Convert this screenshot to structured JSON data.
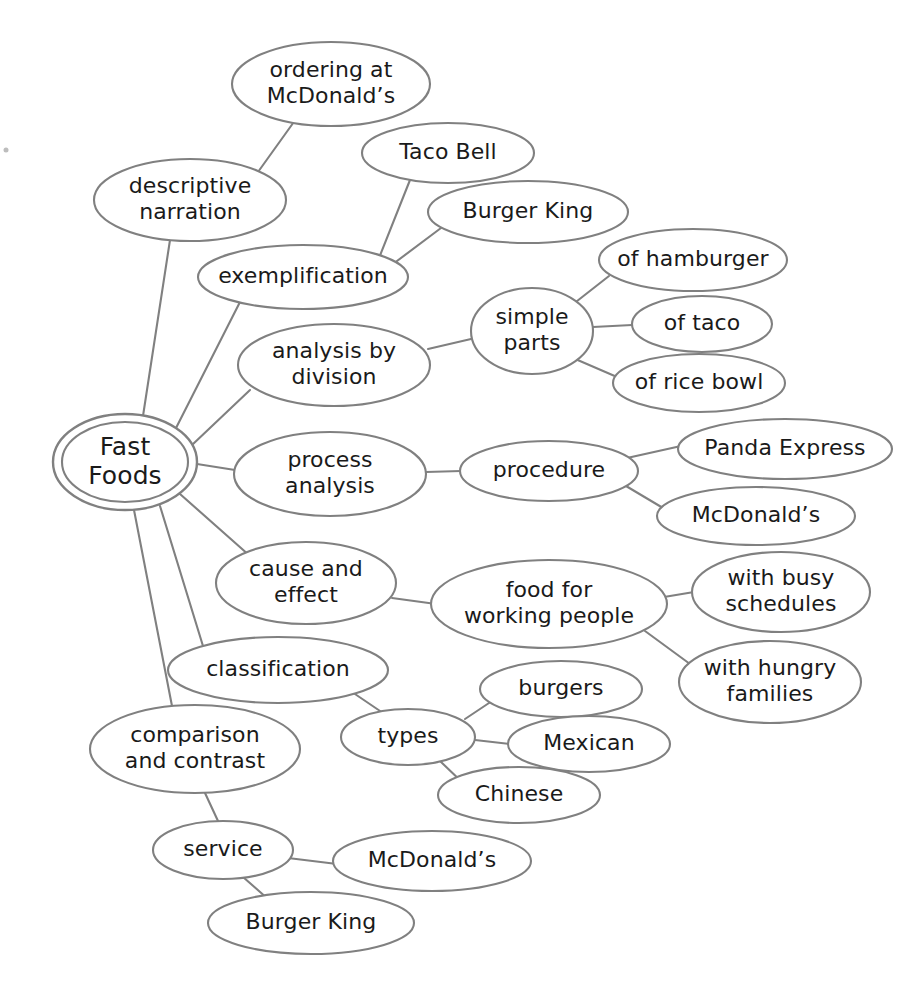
{
  "diagram": {
    "type": "mind-map",
    "style": {
      "background": "#ffffff",
      "node_fill": "#ffffff",
      "node_stroke": "#808080",
      "text_color": "#1a1a1a"
    },
    "root": {
      "id": "fast-foods",
      "label": "Fast Foods",
      "lines": [
        "Fast",
        "Foods"
      ],
      "cx": 125,
      "cy": 462,
      "rx": 72,
      "ry": 48,
      "double_ring": true
    },
    "nodes": [
      {
        "id": "ordering-at-mcdonalds",
        "label": "ordering at McDonald's",
        "lines": [
          "ordering at",
          "McDonald’s"
        ],
        "cx": 331,
        "cy": 84,
        "rx": 99,
        "ry": 42
      },
      {
        "id": "descriptive-narration",
        "label": "descriptive narration",
        "lines": [
          "descriptive",
          "narration"
        ],
        "cx": 190,
        "cy": 200,
        "rx": 96,
        "ry": 41
      },
      {
        "id": "taco-bell",
        "label": "Taco Bell",
        "lines": [
          "Taco Bell"
        ],
        "cx": 448,
        "cy": 153,
        "rx": 86,
        "ry": 30
      },
      {
        "id": "burger-king-ex",
        "label": "Burger King",
        "lines": [
          "Burger King"
        ],
        "cx": 528,
        "cy": 212,
        "rx": 100,
        "ry": 31
      },
      {
        "id": "exemplification",
        "label": "exemplification",
        "lines": [
          "exemplification"
        ],
        "cx": 303,
        "cy": 277,
        "rx": 105,
        "ry": 32
      },
      {
        "id": "of-hamburger",
        "label": "of hamburger",
        "lines": [
          "of hamburger"
        ],
        "cx": 693,
        "cy": 260,
        "rx": 94,
        "ry": 31
      },
      {
        "id": "simple-parts",
        "label": "simple parts",
        "lines": [
          "simple",
          "parts"
        ],
        "cx": 532,
        "cy": 331,
        "rx": 61,
        "ry": 43
      },
      {
        "id": "of-taco",
        "label": "of taco",
        "lines": [
          "of taco"
        ],
        "cx": 702,
        "cy": 324,
        "rx": 70,
        "ry": 28
      },
      {
        "id": "analysis-by-division",
        "label": "analysis by division",
        "lines": [
          "analysis by",
          "division"
        ],
        "cx": 334,
        "cy": 365,
        "rx": 96,
        "ry": 41
      },
      {
        "id": "of-rice-bowl",
        "label": "of rice bowl",
        "lines": [
          "of rice bowl"
        ],
        "cx": 699,
        "cy": 383,
        "rx": 86,
        "ry": 29
      },
      {
        "id": "panda-express",
        "label": "Panda Express",
        "lines": [
          "Panda Express"
        ],
        "cx": 785,
        "cy": 449,
        "rx": 107,
        "ry": 30
      },
      {
        "id": "process-analysis",
        "label": "process analysis",
        "lines": [
          "process",
          "analysis"
        ],
        "cx": 330,
        "cy": 474,
        "rx": 96,
        "ry": 42
      },
      {
        "id": "procedure",
        "label": "procedure",
        "lines": [
          "procedure"
        ],
        "cx": 549,
        "cy": 471,
        "rx": 89,
        "ry": 30
      },
      {
        "id": "mcdonalds-procedure",
        "label": "McDonald's",
        "lines": [
          "McDonald’s"
        ],
        "cx": 756,
        "cy": 516,
        "rx": 99,
        "ry": 29
      },
      {
        "id": "cause-and-effect",
        "label": "cause and effect",
        "lines": [
          "cause and",
          "effect"
        ],
        "cx": 306,
        "cy": 583,
        "rx": 90,
        "ry": 41
      },
      {
        "id": "food-for-working-people",
        "label": "food for working people",
        "lines": [
          "food for",
          "working people"
        ],
        "cx": 549,
        "cy": 604,
        "rx": 118,
        "ry": 44
      },
      {
        "id": "with-busy-schedules",
        "label": "with busy schedules",
        "lines": [
          "with busy",
          "schedules"
        ],
        "cx": 781,
        "cy": 592,
        "rx": 89,
        "ry": 40
      },
      {
        "id": "classification",
        "label": "classification",
        "lines": [
          "classification"
        ],
        "cx": 278,
        "cy": 670,
        "rx": 110,
        "ry": 33
      },
      {
        "id": "burgers",
        "label": "burgers",
        "lines": [
          "burgers"
        ],
        "cx": 561,
        "cy": 689,
        "rx": 81,
        "ry": 28
      },
      {
        "id": "with-hungry-families",
        "label": "with hungry families",
        "lines": [
          "with hungry",
          "families"
        ],
        "cx": 770,
        "cy": 682,
        "rx": 91,
        "ry": 41
      },
      {
        "id": "mexican",
        "label": "Mexican",
        "lines": [
          "Mexican"
        ],
        "cx": 589,
        "cy": 744,
        "rx": 81,
        "ry": 28
      },
      {
        "id": "types",
        "label": "types",
        "lines": [
          "types"
        ],
        "cx": 408,
        "cy": 737,
        "rx": 67,
        "ry": 28
      },
      {
        "id": "comparison-and-contrast",
        "label": "comparison and contrast",
        "lines": [
          "comparison",
          "and contrast"
        ],
        "cx": 195,
        "cy": 749,
        "rx": 105,
        "ry": 44
      },
      {
        "id": "chinese",
        "label": "Chinese",
        "lines": [
          "Chinese"
        ],
        "cx": 519,
        "cy": 795,
        "rx": 81,
        "ry": 28
      },
      {
        "id": "service",
        "label": "service",
        "lines": [
          "service"
        ],
        "cx": 223,
        "cy": 850,
        "rx": 70,
        "ry": 29
      },
      {
        "id": "mcdonalds-service",
        "label": "McDonald's",
        "lines": [
          "McDonald’s"
        ],
        "cx": 432,
        "cy": 861,
        "rx": 99,
        "ry": 30
      },
      {
        "id": "burger-king-service",
        "label": "Burger King",
        "lines": [
          "Burger King"
        ],
        "cx": 311,
        "cy": 923,
        "rx": 103,
        "ry": 31
      }
    ],
    "edges": [
      {
        "id": "edge-root-descriptive-narration",
        "from": "fast-foods",
        "to": "descriptive-narration",
        "x1": 143,
        "y1": 416,
        "x2": 170,
        "y2": 240
      },
      {
        "id": "edge-descriptive-ordering",
        "from": "descriptive-narration",
        "to": "ordering-at-mcdonalds",
        "x1": 258,
        "y1": 172,
        "x2": 296,
        "y2": 119
      },
      {
        "id": "edge-root-exemplification",
        "from": "fast-foods",
        "to": "exemplification",
        "x1": 175,
        "y1": 430,
        "x2": 241,
        "y2": 300
      },
      {
        "id": "edge-exemplification-taco-bell",
        "from": "exemplification",
        "to": "taco-bell",
        "x1": 379,
        "y1": 258,
        "x2": 410,
        "y2": 180
      },
      {
        "id": "edge-exemplification-burger-king",
        "from": "exemplification",
        "to": "burger-king-ex",
        "x1": 393,
        "y1": 264,
        "x2": 441,
        "y2": 228
      },
      {
        "id": "edge-root-analysis-division",
        "from": "fast-foods",
        "to": "analysis-by-division",
        "x1": 192,
        "y1": 445,
        "x2": 250,
        "y2": 390
      },
      {
        "id": "edge-analysis-simple-parts",
        "from": "analysis-by-division",
        "to": "simple-parts",
        "x1": 428,
        "y1": 349,
        "x2": 471,
        "y2": 339
      },
      {
        "id": "edge-simple-of-hamburger",
        "from": "simple-parts",
        "to": "of-hamburger",
        "x1": 572,
        "y1": 305,
        "x2": 609,
        "y2": 276
      },
      {
        "id": "edge-simple-of-taco",
        "from": "simple-parts",
        "to": "of-taco",
        "x1": 593,
        "y1": 327,
        "x2": 632,
        "y2": 325
      },
      {
        "id": "edge-simple-of-rice-bowl",
        "from": "simple-parts",
        "to": "of-rice-bowl",
        "x1": 573,
        "y1": 358,
        "x2": 617,
        "y2": 377
      },
      {
        "id": "edge-root-process-analysis",
        "from": "fast-foods",
        "to": "process-analysis",
        "x1": 197,
        "y1": 464,
        "x2": 235,
        "y2": 470
      },
      {
        "id": "edge-process-procedure",
        "from": "process-analysis",
        "to": "procedure",
        "x1": 426,
        "y1": 472,
        "x2": 461,
        "y2": 471
      },
      {
        "id": "edge-procedure-panda",
        "from": "procedure",
        "to": "panda-express",
        "x1": 627,
        "y1": 458,
        "x2": 681,
        "y2": 446
      },
      {
        "id": "edge-procedure-mcdonalds",
        "from": "procedure",
        "to": "mcdonalds-procedure",
        "x1": 626,
        "y1": 486,
        "x2": 663,
        "y2": 508
      },
      {
        "id": "edge-root-cause-effect",
        "from": "fast-foods",
        "to": "cause-and-effect",
        "x1": 180,
        "y1": 494,
        "x2": 250,
        "y2": 556
      },
      {
        "id": "edge-cause-food-working",
        "from": "cause-and-effect",
        "to": "food-for-working-people",
        "x1": 392,
        "y1": 598,
        "x2": 436,
        "y2": 604
      },
      {
        "id": "edge-food-busy",
        "from": "food-for-working-people",
        "to": "with-busy-schedules",
        "x1": 664,
        "y1": 597,
        "x2": 694,
        "y2": 592
      },
      {
        "id": "edge-food-hungry",
        "from": "food-for-working-people",
        "to": "with-hungry-families",
        "x1": 645,
        "y1": 631,
        "x2": 690,
        "y2": 664
      },
      {
        "id": "edge-root-classification",
        "from": "fast-foods",
        "to": "classification",
        "x1": 160,
        "y1": 506,
        "x2": 203,
        "y2": 646
      },
      {
        "id": "edge-classification-types",
        "from": "classification",
        "to": "types",
        "x1": 352,
        "y1": 692,
        "x2": 383,
        "y2": 713
      },
      {
        "id": "edge-types-burgers",
        "from": "types",
        "to": "burgers",
        "x1": 465,
        "y1": 719,
        "x2": 492,
        "y2": 701
      },
      {
        "id": "edge-types-mexican",
        "from": "types",
        "to": "mexican",
        "x1": 475,
        "y1": 740,
        "x2": 510,
        "y2": 744
      },
      {
        "id": "edge-types-chinese",
        "from": "types",
        "to": "chinese",
        "x1": 440,
        "y1": 761,
        "x2": 465,
        "y2": 785
      },
      {
        "id": "edge-root-comparison",
        "from": "fast-foods",
        "to": "comparison-and-contrast",
        "x1": 134,
        "y1": 510,
        "x2": 172,
        "y2": 706
      },
      {
        "id": "edge-comparison-service",
        "from": "comparison-and-contrast",
        "to": "service",
        "x1": 205,
        "y1": 793,
        "x2": 218,
        "y2": 821
      },
      {
        "id": "edge-service-mcdonalds",
        "from": "service",
        "to": "mcdonalds-service",
        "x1": 288,
        "y1": 858,
        "x2": 337,
        "y2": 864
      },
      {
        "id": "edge-service-burger-king",
        "from": "service",
        "to": "burger-king-service",
        "x1": 243,
        "y1": 877,
        "x2": 268,
        "y2": 899
      }
    ]
  }
}
